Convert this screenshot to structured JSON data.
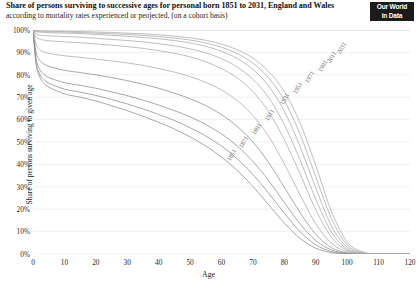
{
  "header": {
    "title": "Share of persons surviving to successive ages for personal born 1851 to 2031, England and Wales",
    "subtitle": "according to mortality rates experienced or peojected, (on a cohort basis)"
  },
  "logo": {
    "line1": "Our World",
    "line2": "in Data"
  },
  "colors": {
    "background": "#ffffff",
    "curve": "#a8a8a8",
    "curve_dark": "#8c8c8c",
    "gridline": "#e6e6e6",
    "text": "#1a1a1a",
    "label": "#6e6e6e",
    "logo_bg": "#1b1b1b"
  },
  "chart_data": {
    "type": "line",
    "title": "Share of persons surviving to successive ages for personal born 1851 to 2031, England and Wales",
    "subtitle": "according to mortality rates experienced or peojected, (on a cohort basis)",
    "xlabel": "Age",
    "ylabel": "Share of persons surviving to given age",
    "xlim": [
      0,
      120
    ],
    "ylim": [
      0,
      100
    ],
    "grid": true,
    "legend": "inline-series-labels",
    "xticks": [
      0,
      10,
      20,
      30,
      40,
      50,
      60,
      70,
      80,
      90,
      100,
      110,
      120
    ],
    "xtick_labels": [
      "0",
      "10",
      "20",
      "30",
      "40",
      "50",
      "60",
      "70",
      "80",
      "90",
      "100",
      "110",
      "120"
    ],
    "yticks": [
      0,
      10,
      20,
      30,
      40,
      50,
      60,
      70,
      80,
      90,
      100
    ],
    "ytick_labels": [
      "0%",
      "10%",
      "20%",
      "30%",
      "40%",
      "50%",
      "60%",
      "70%",
      "80%",
      "90%",
      "100%"
    ],
    "x": [
      0,
      1,
      2,
      3,
      5,
      10,
      15,
      20,
      25,
      30,
      35,
      40,
      45,
      50,
      55,
      60,
      65,
      70,
      75,
      80,
      85,
      90,
      95,
      100,
      105,
      110,
      115,
      120
    ],
    "series": [
      {
        "name": "1851",
        "label": "1851",
        "label_x": 63,
        "label_y": 44,
        "values": [
          100,
          84.5,
          79.5,
          77.0,
          74.5,
          71.5,
          70.0,
          68.3,
          66.2,
          64.0,
          61.5,
          58.8,
          55.8,
          52.3,
          48.2,
          43.3,
          37.3,
          30.2,
          22.0,
          13.8,
          7.0,
          2.6,
          0.6,
          0.1,
          0,
          0,
          0,
          0
        ]
      },
      {
        "name": "1871",
        "label": "1871",
        "label_x": 67,
        "label_y": 50,
        "values": [
          100,
          85.5,
          80.8,
          78.5,
          76.3,
          73.6,
          72.3,
          70.8,
          69.0,
          67.0,
          64.8,
          62.3,
          59.6,
          56.4,
          52.7,
          48.2,
          42.5,
          35.5,
          27.2,
          18.2,
          10.0,
          4.1,
          1.1,
          0.2,
          0,
          0,
          0,
          0
        ]
      },
      {
        "name": "1891",
        "label": "1891",
        "label_x": 71,
        "label_y": 56,
        "values": [
          100,
          87.0,
          82.8,
          80.8,
          78.8,
          76.5,
          75.3,
          74.0,
          72.4,
          70.7,
          68.7,
          66.5,
          64.0,
          61.2,
          57.8,
          53.6,
          48.2,
          41.3,
          32.8,
          23.0,
          13.5,
          6.0,
          1.8,
          0.3,
          0,
          0,
          0,
          0
        ]
      },
      {
        "name": "1911",
        "label": "1911",
        "label_x": 75,
        "label_y": 62,
        "values": [
          100,
          90.0,
          86.8,
          85.3,
          83.8,
          82.0,
          81.0,
          80.0,
          78.8,
          77.4,
          75.8,
          74.0,
          71.8,
          69.3,
          66.2,
          62.2,
          57.0,
          50.0,
          40.8,
          29.8,
          18.5,
          8.8,
          2.8,
          0.5,
          0,
          0,
          0,
          0
        ]
      },
      {
        "name": "1931",
        "label": "1931",
        "label_x": 80,
        "label_y": 69,
        "values": [
          100,
          93.5,
          91.5,
          90.5,
          89.6,
          88.5,
          87.8,
          87.0,
          86.2,
          85.3,
          84.2,
          82.8,
          81.2,
          79.2,
          76.6,
          73.2,
          68.5,
          61.8,
          52.5,
          40.2,
          26.5,
          13.5,
          4.8,
          1.0,
          0.1,
          0,
          0,
          0
        ]
      },
      {
        "name": "1951",
        "label": "1951",
        "label_x": 84,
        "label_y": 74,
        "values": [
          100,
          96.8,
          96.0,
          95.6,
          95.2,
          94.7,
          94.3,
          93.8,
          93.2,
          92.6,
          91.8,
          90.8,
          89.6,
          88.0,
          85.8,
          82.8,
          78.6,
          72.5,
          63.5,
          51.0,
          35.8,
          19.8,
          7.5,
          1.6,
          0.2,
          0,
          0,
          0
        ]
      },
      {
        "name": "1971",
        "label": "1971",
        "label_x": 88,
        "label_y": 79,
        "values": [
          100,
          98.2,
          97.8,
          97.6,
          97.4,
          97.1,
          96.8,
          96.3,
          95.8,
          95.3,
          94.7,
          93.9,
          92.9,
          91.6,
          89.8,
          87.2,
          83.5,
          78.0,
          69.8,
          57.8,
          42.0,
          24.5,
          9.8,
          2.2,
          0.3,
          0,
          0,
          0
        ]
      },
      {
        "name": "1991",
        "label": "1991",
        "label_x": 92,
        "label_y": 84,
        "values": [
          100,
          99.2,
          99.0,
          98.9,
          98.8,
          98.6,
          98.4,
          98.0,
          97.6,
          97.2,
          96.7,
          96.1,
          95.3,
          94.2,
          92.7,
          90.5,
          87.3,
          82.4,
          75.0,
          63.8,
          48.0,
          29.5,
          12.5,
          3.0,
          0.4,
          0,
          0,
          0
        ]
      },
      {
        "name": "2011",
        "label": "2011",
        "label_x": 95,
        "label_y": 88,
        "values": [
          100,
          99.5,
          99.4,
          99.3,
          99.2,
          99.1,
          98.9,
          98.6,
          98.3,
          98.0,
          97.6,
          97.1,
          96.4,
          95.5,
          94.2,
          92.3,
          89.5,
          85.2,
          78.6,
          68.5,
          53.5,
          34.5,
          15.8,
          4.1,
          0.6,
          0.1,
          0,
          0
        ]
      },
      {
        "name": "2031",
        "label": "2031",
        "label_x": 98,
        "label_y": 92,
        "values": [
          100,
          99.7,
          99.6,
          99.6,
          99.5,
          99.4,
          99.3,
          99.1,
          98.9,
          98.6,
          98.3,
          97.9,
          97.3,
          96.5,
          95.4,
          93.7,
          91.2,
          87.4,
          81.5,
          72.5,
          58.5,
          39.5,
          19.0,
          5.4,
          0.9,
          0.1,
          0,
          0
        ]
      }
    ]
  }
}
